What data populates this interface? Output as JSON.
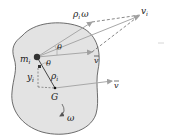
{
  "figure": {
    "colors": {
      "body_fill": "#e3e3e3",
      "body_stroke": "#4a4a4a",
      "vector": "#a8a8a8",
      "dashed": "#555555",
      "ink": "#1a1a1a"
    },
    "labels": {
      "particle_mass": "m",
      "particle_mass_sub": "i",
      "velocity_i": "v",
      "velocity_i_sub": "i",
      "rel_velocity": "ρ",
      "rel_velocity_sub": "i",
      "rel_velocity_omega": "ω",
      "vbar_top": "v",
      "vbar_G": "v",
      "theta_top": "θ",
      "theta_mid": "θ",
      "y_dist": "y",
      "y_dist_sub": "i",
      "rho_i": "ρ",
      "rho_i_sub": "i",
      "center_mass": "G",
      "angular_velocity": "ω"
    }
  }
}
